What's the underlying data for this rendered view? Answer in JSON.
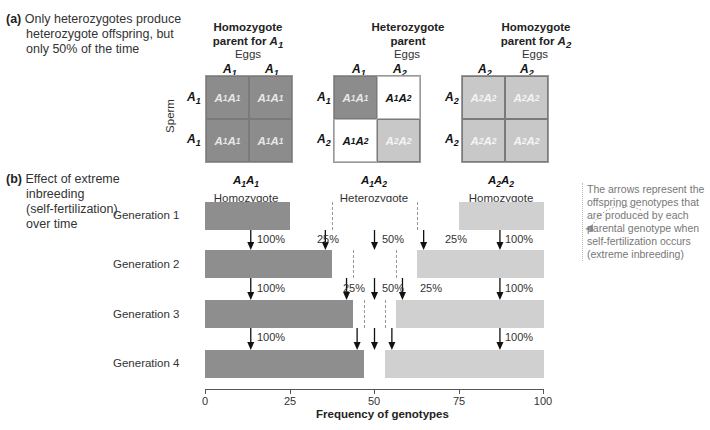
{
  "part_a": {
    "letter": "(a)",
    "lines": [
      "Only heterozygotes produce",
      "heterozygote offspring, but",
      "only 50% of the time"
    ]
  },
  "part_b": {
    "letter": "(b)",
    "lines": [
      "Effect of extreme",
      "inbreeding",
      "(self-fertilization)",
      "over time"
    ]
  },
  "punnett": {
    "eggs_label": "Eggs",
    "sperm_label": "Sperm",
    "squares": [
      {
        "title_line1": "Homozygote",
        "title_line2": "parent for",
        "title_allele": "A",
        "title_sub": "1",
        "egg_alleles": [
          {
            "a": "A",
            "s": "1"
          },
          {
            "a": "A",
            "s": "1"
          }
        ],
        "sperm_alleles": [
          {
            "a": "A",
            "s": "1"
          },
          {
            "a": "A",
            "s": "1"
          }
        ],
        "cells": [
          "A1A1",
          "A1A1",
          "A1A1",
          "A1A1"
        ]
      },
      {
        "title_line1": "Heterozygote",
        "title_line2": "parent",
        "egg_alleles": [
          {
            "a": "A",
            "s": "1"
          },
          {
            "a": "A",
            "s": "2"
          }
        ],
        "sperm_alleles": [
          {
            "a": "A",
            "s": "1"
          },
          {
            "a": "A",
            "s": "2"
          }
        ],
        "cells": [
          "A1A1",
          "A1A2",
          "A1A2",
          "A2A2"
        ]
      },
      {
        "title_line1": "Homozygote",
        "title_line2": "parent for",
        "title_allele": "A",
        "title_sub": "2",
        "egg_alleles": [
          {
            "a": "A",
            "s": "2"
          },
          {
            "a": "A",
            "s": "2"
          }
        ],
        "sperm_alleles": [
          {
            "a": "A",
            "s": "2"
          },
          {
            "a": "A",
            "s": "2"
          }
        ],
        "cells": [
          "A2A2",
          "A2A2",
          "A2A2",
          "A2A2"
        ]
      }
    ]
  },
  "columns": [
    {
      "genotype_a": "A",
      "s1": "1",
      "genotype_b": "A",
      "s2": "1",
      "label": "Homozygote"
    },
    {
      "genotype_a": "A",
      "s1": "1",
      "genotype_b": "A",
      "s2": "2",
      "label": "Heterozygote"
    },
    {
      "genotype_a": "A",
      "s1": "2",
      "genotype_b": "A",
      "s2": "2",
      "label": "Homozygote"
    }
  ],
  "generations": [
    {
      "label": "Generation 1",
      "A1A1": 25,
      "A1A2": 50,
      "A2A2": 25
    },
    {
      "label": "Generation 2",
      "A1A1": 37.5,
      "A1A2": 25,
      "A2A2": 37.5
    },
    {
      "label": "Generation 3",
      "A1A1": 43.75,
      "A1A2": 12.5,
      "A2A2": 43.75
    },
    {
      "label": "Generation 4",
      "A1A1": 46.875,
      "A1A2": 6.25,
      "A2A2": 46.875
    }
  ],
  "arrow_labels": {
    "g1_to_g2": [
      "100%",
      "25%",
      "50%",
      "25%",
      "100%"
    ],
    "g2_to_g3": [
      "100%",
      "25%",
      "50%",
      "25%",
      "100%"
    ],
    "g3_to_g4": [
      "100%",
      "100%"
    ]
  },
  "axis": {
    "ticks": [
      "0",
      "25",
      "50",
      "75",
      "100"
    ],
    "title": "Frequency of genotypes"
  },
  "note": {
    "lines": [
      "The arrows represent the",
      "offspring genotypes that",
      "are produced by each",
      "parental genotype when",
      "self-fertilization occurs",
      "(extreme inbreeding)"
    ]
  },
  "colors": {
    "homozygote_A1": "#8e8e8e",
    "heterozygote": "#ffffff",
    "homozygote_A2": "#d0d0d0"
  }
}
